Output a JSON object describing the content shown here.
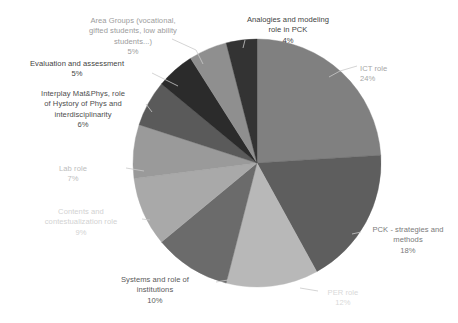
{
  "chart_data": {
    "type": "pie",
    "title": "",
    "subtitle": "",
    "xlabel": "",
    "ylabel": "",
    "legend_position": "none",
    "grid": false,
    "units": "percent",
    "total": 100,
    "start_angle_deg": 0,
    "direction": "clockwise",
    "categories": [
      "ICT role",
      "PCK - strategies and methods",
      "PER role",
      "Systems and role of institutions",
      "Contents and contestualization role",
      "Lab role",
      "Interplay Mat&Phys, role of Hystory of Phys and interdisciplinarity",
      "Evaluation and assessment",
      "Area Groups (vocational, gifted students, low ability students...)",
      "Analogies and modeling role in PCK"
    ],
    "values": [
      24,
      18,
      12,
      10,
      9,
      7,
      6,
      5,
      5,
      4
    ],
    "slices": [
      {
        "name": "ICT role",
        "label_lines": "ICT role",
        "value": 24,
        "value_label": "24%",
        "color": "#808080",
        "text_color": "#a6a6a6"
      },
      {
        "name": "PCK - strategies and methods",
        "label_lines": "PCK - strategies and\nmethods",
        "value": 18,
        "value_label": "18%",
        "color": "#5e5e5e",
        "text_color": "#7a7a7a"
      },
      {
        "name": "PER role",
        "label_lines": "PER role",
        "value": 12,
        "value_label": "12%",
        "color": "#b8b8b8",
        "text_color": "#d9d9d9"
      },
      {
        "name": "Systems and role of institutions",
        "label_lines": "Systems and role of\ninstitutions",
        "value": 10,
        "value_label": "10%",
        "color": "#6b6b6b",
        "text_color": "#595959"
      },
      {
        "name": "Contents and contestualization role",
        "label_lines": "Contents and\ncontestualization role",
        "value": 9,
        "value_label": "9%",
        "color": "#a9a9a9",
        "text_color": "#d2d2d2"
      },
      {
        "name": "Lab role",
        "label_lines": "Lab role",
        "value": 7,
        "value_label": "7%",
        "color": "#9a9a9a",
        "text_color": "#bdbdbd"
      },
      {
        "name": "Interplay Mat&Phys, role of Hystory of Phys and interdisciplinarity",
        "label_lines": "Interplay Mat&Phys, role\nof Hystory of Phys and\ninterdisciplinarity",
        "value": 6,
        "value_label": "6%",
        "color": "#5a5a5a",
        "text_color": "#4d4d4d"
      },
      {
        "name": "Evaluation and assessment",
        "label_lines": "Evaluation and assessment",
        "value": 5,
        "value_label": "5%",
        "color": "#2b2b2b",
        "text_color": "#3f3f3f"
      },
      {
        "name": "Area Groups (vocational, gifted students, low ability students...)",
        "label_lines": "Area Groups (vocational,\ngifted students, low ability\nstudents...)",
        "value": 5,
        "value_label": "5%",
        "color": "#8f8f8f",
        "text_color": "#9c9c9c"
      },
      {
        "name": "Analogies and modeling role in PCK",
        "label_lines": "Analogies and modeling\nrole in PCK",
        "value": 4,
        "value_label": "4%",
        "color": "#333333",
        "text_color": "#3f3f3f"
      }
    ]
  },
  "geometry": {
    "center_x": 257,
    "center_y": 163,
    "radius": 124,
    "leader_color": "#c9c9c9"
  },
  "labels": [
    {
      "key": "ict-role",
      "left": 360,
      "top": 64,
      "width": 92,
      "align": "left"
    },
    {
      "key": "pck-strategies",
      "left": 360,
      "top": 225,
      "width": 96,
      "align": "center"
    },
    {
      "key": "per-role",
      "left": 310,
      "top": 288,
      "width": 66,
      "align": "center"
    },
    {
      "key": "systems",
      "left": 94,
      "top": 275,
      "width": 122,
      "align": "center"
    },
    {
      "key": "contents",
      "left": 22,
      "top": 207,
      "width": 118,
      "align": "center"
    },
    {
      "key": "lab-role",
      "left": 37,
      "top": 164,
      "width": 72,
      "align": "center"
    },
    {
      "key": "interplay",
      "left": 18,
      "top": 89,
      "width": 130,
      "align": "center"
    },
    {
      "key": "evaluation",
      "left": 10,
      "top": 59,
      "width": 134,
      "align": "center"
    },
    {
      "key": "area-groups",
      "left": 66,
      "top": 16,
      "width": 134,
      "align": "center"
    },
    {
      "key": "analogies",
      "left": 232,
      "top": 15,
      "width": 112,
      "align": "center"
    }
  ],
  "leaders": [
    {
      "key": "ict-role",
      "points": "340,71 357,66"
    },
    {
      "key": "ict-role-2",
      "points": "329,77 340,71"
    },
    {
      "key": "pck-strategies",
      "points": "352,234 361,232"
    },
    {
      "key": "per-role",
      "points": "300,288 318,291"
    },
    {
      "key": "systems",
      "points": "228,280 216,282"
    },
    {
      "key": "contents",
      "points": "150,220 142,219"
    },
    {
      "key": "lab-role",
      "points": "144,171 126,168"
    },
    {
      "key": "interplay",
      "points": "152,112 146,104"
    },
    {
      "key": "evaluation",
      "points": "178,86 152,73"
    },
    {
      "key": "area-groups",
      "points": "203,64 196,50"
    },
    {
      "key": "area-groups-2",
      "points": "196,50 172,39"
    },
    {
      "key": "analogies",
      "points": "243,48 245,40"
    }
  ]
}
